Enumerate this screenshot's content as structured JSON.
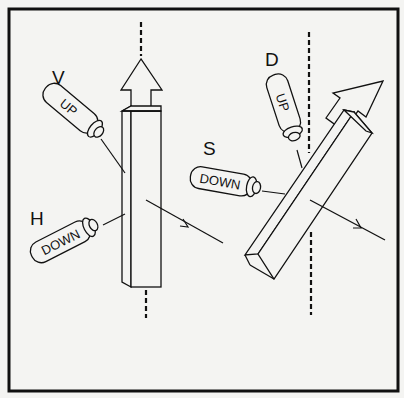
{
  "figure": {
    "colors": {
      "ink": "#111111",
      "paper": "#f4f4f2"
    }
  },
  "labels": {
    "v": "V",
    "h": "H",
    "d": "D",
    "s": "S"
  },
  "cylinders": {
    "v": {
      "label": "V",
      "text": "UP"
    },
    "h": {
      "label": "H",
      "text": "DOWN"
    },
    "d": {
      "label": "D",
      "text": "UP"
    },
    "s": {
      "label": "S",
      "text": "DOWN"
    }
  }
}
